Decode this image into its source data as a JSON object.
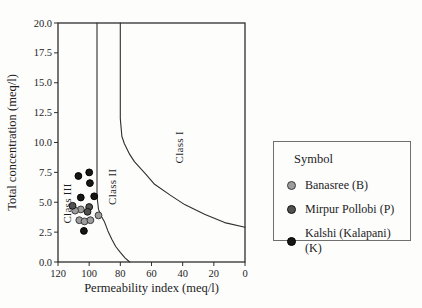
{
  "figure_title": "Doneen permeability index classification diagram",
  "chart_data": {
    "type": "scatter",
    "title": "",
    "xlabel": "Permeability index (meq/l)",
    "ylabel": "Total concentration (meq/l)",
    "xlim": [
      120,
      0
    ],
    "ylim": [
      0,
      20
    ],
    "grid": false,
    "legend_position": "right-outside",
    "x_ticks": {
      "values": [
        120,
        100,
        80,
        60,
        40,
        20,
        0
      ],
      "labels": [
        "120",
        "100",
        "80",
        "60",
        "40",
        "20",
        "0"
      ]
    },
    "y_ticks": {
      "values": [
        0,
        2.5,
        5,
        7.5,
        10,
        12.5,
        15,
        17.5,
        20
      ],
      "labels": [
        "0.0",
        "2.5",
        "5.0",
        "7.5",
        "10.0",
        "12.5",
        "15.0",
        "17.5",
        "20.0"
      ]
    },
    "class_labels": [
      {
        "text": "Class I",
        "x": 40,
        "y": 9.6
      },
      {
        "text": "Class II",
        "x": 82.5,
        "y": 6.3
      },
      {
        "text": "Class III",
        "x": 111.5,
        "y": 4.9
      }
    ],
    "boundaries": [
      {
        "name": "class1-class2-boundary",
        "points": [
          [
            80,
            20
          ],
          [
            80,
            12
          ],
          [
            79,
            10.5
          ],
          [
            77.4,
            9.9
          ],
          [
            74,
            9.0
          ],
          [
            71,
            8.4
          ],
          [
            64,
            7.4
          ],
          [
            58,
            6.5
          ],
          [
            48,
            5.6
          ],
          [
            38.7,
            4.8
          ],
          [
            26,
            4.0
          ],
          [
            13,
            3.3
          ],
          [
            0,
            2.9
          ]
        ]
      },
      {
        "name": "class2-class3-boundary",
        "points": [
          [
            95,
            20
          ],
          [
            95,
            5.5
          ],
          [
            94,
            4.4
          ],
          [
            92.5,
            3.9
          ],
          [
            90.3,
            3.4
          ],
          [
            88,
            2.6
          ],
          [
            85.5,
            1.9
          ],
          [
            83,
            1.3
          ],
          [
            80,
            0.8
          ],
          [
            77,
            0.35
          ],
          [
            74,
            0
          ]
        ]
      }
    ],
    "series": [
      {
        "name": "Banasree (B)",
        "marker": {
          "fill": "#9d9d9d",
          "stroke": "#3c3c3c"
        },
        "points": [
          [
            105.4,
            4.4
          ],
          [
            109,
            4.3
          ],
          [
            106.3,
            3.5
          ],
          [
            103,
            3.4
          ],
          [
            99.2,
            3.5
          ],
          [
            94,
            3.9
          ]
        ]
      },
      {
        "name": "Mirpur Pollobi (P)",
        "marker": {
          "fill": "#525252",
          "stroke": "#141414"
        },
        "points": [
          [
            110.6,
            4.7
          ],
          [
            100,
            4.6
          ],
          [
            101.1,
            4.2
          ]
        ]
      },
      {
        "name": "Kalshi (Kalapani) (K)",
        "marker": {
          "fill": "#161616",
          "stroke": "#000000"
        },
        "points": [
          [
            106.9,
            7.2
          ],
          [
            100,
            7.5
          ],
          [
            99.5,
            6.6
          ],
          [
            105.4,
            5.4
          ],
          [
            96.8,
            5.5
          ],
          [
            103.4,
            2.6
          ]
        ]
      }
    ]
  },
  "legend": {
    "title": "Symbol"
  },
  "colors": {
    "axis": "#2e2e2e",
    "curve": "#2e2e2e",
    "text": "#1c1c1c",
    "legend_border": "#6f6f6f",
    "background": "#fdfdfc"
  }
}
